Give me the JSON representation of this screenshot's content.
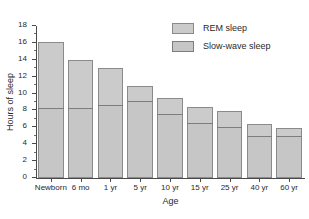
{
  "chart_data": {
    "type": "bar",
    "stacked": true,
    "title": "",
    "xlabel": "Age",
    "ylabel": "Hours of sleep",
    "ylim": [
      0,
      18
    ],
    "ytick_step": 2,
    "yminor_step": 1,
    "grid": false,
    "legend_position": "top-right",
    "categories": [
      "Newborn",
      "6 mo",
      "1 yr",
      "5 yr",
      "10 yr",
      "15 yr",
      "25 yr",
      "40 yr",
      "60 yr"
    ],
    "ytick_labels": [
      "0",
      "2",
      "4",
      "6",
      "8",
      "10",
      "12",
      "14",
      "16",
      "18"
    ],
    "series": [
      {
        "name": "Slow-wave sleep",
        "values": [
          8.0,
          8.0,
          8.4,
          8.9,
          7.4,
          6.3,
          5.8,
          4.75,
          4.75
        ]
      },
      {
        "name": "REM sleep",
        "values": [
          8.0,
          5.9,
          4.5,
          1.9,
          1.9,
          2.0,
          2.0,
          1.5,
          1.0
        ]
      }
    ],
    "totals": [
      16.0,
      13.9,
      12.9,
      10.8,
      9.3,
      8.3,
      7.8,
      6.25,
      5.75
    ],
    "colors": {
      "rem_fill": "#cbcbcb",
      "slow_fill": "#c6c6c6",
      "bar_border": "#8a8a8a",
      "divider": "#7d7d7d",
      "axis": "#4a4a4a",
      "text": "#2a2a2a",
      "background": "#ffffff"
    }
  },
  "legend": {
    "items": [
      {
        "label": "REM sleep"
      },
      {
        "label": "Slow-wave sleep"
      }
    ]
  },
  "caption": {
    "text": ""
  }
}
